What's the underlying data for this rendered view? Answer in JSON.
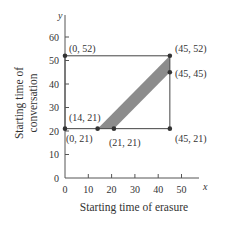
{
  "chart_data": {
    "type": "area",
    "title": "",
    "xlabel": "Starting time of erasure",
    "ylabel": "Starting time of conversation",
    "ylabel_lines": [
      "Starting time of",
      "conversation"
    ],
    "x_var": "x",
    "y_var": "y",
    "xlim": [
      0,
      55
    ],
    "ylim": [
      0,
      65
    ],
    "x_ticks": [
      0,
      10,
      20,
      30,
      40,
      50
    ],
    "y_ticks": [
      0,
      10,
      20,
      30,
      40,
      50,
      60
    ],
    "grid": false,
    "rectangle": {
      "x": [
        0,
        45
      ],
      "y": [
        21,
        52
      ]
    },
    "shaded_region": {
      "description": "parallelogram band between y = x + 7 and y = x",
      "vertices": [
        [
          14,
          21
        ],
        [
          21,
          21
        ],
        [
          45,
          45
        ],
        [
          45,
          52
        ]
      ],
      "color": "#8c8c8c"
    },
    "points": [
      {
        "x": 0,
        "y": 52,
        "label": "(0, 52)"
      },
      {
        "x": 45,
        "y": 52,
        "label": "(45, 52)"
      },
      {
        "x": 45,
        "y": 45,
        "label": "(45, 45)"
      },
      {
        "x": 14,
        "y": 21,
        "label": "(14, 21)"
      },
      {
        "x": 0,
        "y": 21,
        "label": "(0, 21)"
      },
      {
        "x": 21,
        "y": 21,
        "label": "(21, 21)"
      },
      {
        "x": 45,
        "y": 21,
        "label": "(45, 21)"
      }
    ]
  },
  "colors": {
    "axis": "#555555",
    "line": "#444444",
    "band": "#8c8c8c",
    "point": "#333333"
  }
}
